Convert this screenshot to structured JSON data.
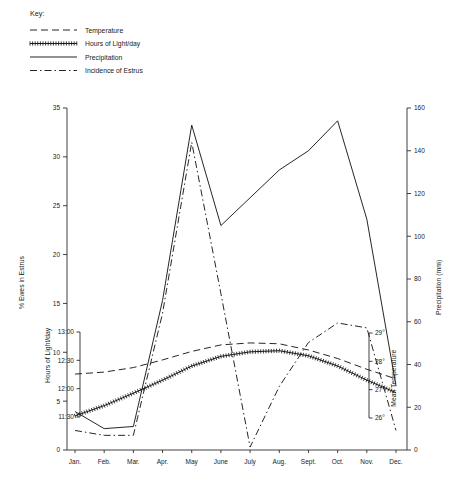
{
  "key": {
    "title": "Key:",
    "entries": [
      {
        "label": "Temperature",
        "style": "dashed"
      },
      {
        "label": "Hours of Light/day",
        "style": "crossed"
      },
      {
        "label": "Precipitation",
        "style": "solid"
      },
      {
        "label": "Incidence of Estrus",
        "style": "dash-dot"
      }
    ]
  },
  "chart_data": {
    "type": "line",
    "title": "",
    "xlabel": "",
    "categories": [
      "Jan.",
      "Feb.",
      "Mar.",
      "Apr.",
      "May",
      "June",
      "July",
      "Aug.",
      "Sept.",
      "Oct.",
      "Nov.",
      "Dec."
    ],
    "axes": {
      "left_primary": {
        "label": "% Ewes in Estrus",
        "ticks": [
          "0",
          "5",
          "10",
          "15",
          "20",
          "25",
          "30",
          "35"
        ],
        "range": [
          0,
          35
        ]
      },
      "left_secondary": {
        "label": "Hours of Light/day",
        "ticks": [
          "11:30",
          "12:00",
          "12:30",
          "13:00"
        ],
        "range": [
          11.5,
          13.0
        ]
      },
      "right_primary": {
        "label": "Precipitation (mm)",
        "ticks": [
          "0",
          "20",
          "40",
          "60",
          "80",
          "100",
          "120",
          "140",
          "160"
        ],
        "range": [
          0,
          160
        ]
      },
      "right_secondary": {
        "label": "Mean Temperature",
        "ticks": [
          "26°",
          "27°",
          "28°",
          "29°"
        ],
        "range": [
          26,
          29
        ]
      }
    },
    "series": [
      {
        "name": "Incidence of Estrus",
        "style": "dash-dot",
        "axis": "left_primary",
        "unit": "% Ewes in Estrus",
        "values": [
          2.0,
          1.5,
          1.5,
          14.0,
          31.5,
          16.0,
          0.3,
          6.5,
          11.0,
          13.0,
          12.5,
          2.0
        ]
      },
      {
        "name": "Precipitation",
        "style": "solid",
        "axis": "right_primary",
        "unit": "mm",
        "values": [
          18,
          10,
          11,
          70,
          152,
          105,
          118,
          131,
          140,
          154,
          108,
          30
        ]
      },
      {
        "name": "Hours of Light/day",
        "style": "crossed",
        "axis": "left_secondary",
        "unit": "hours",
        "values": [
          11.52,
          11.7,
          11.92,
          12.15,
          12.4,
          12.57,
          12.65,
          12.67,
          12.58,
          12.4,
          12.15,
          11.93
        ]
      },
      {
        "name": "Temperature",
        "style": "dashed",
        "axis": "right_secondary",
        "unit": "°C",
        "values": [
          27.55,
          27.62,
          27.78,
          28.05,
          28.35,
          28.58,
          28.65,
          28.62,
          28.4,
          28.1,
          27.72,
          27.38
        ]
      }
    ],
    "grid": false,
    "legend_position": "top-left"
  }
}
